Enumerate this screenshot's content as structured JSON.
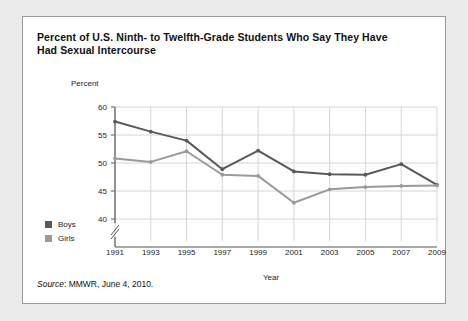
{
  "title": "Percent of U.S. Ninth- to Twelfth-Grade Students Who Say They Have Had Sexual Intercourse",
  "source_prefix": "Source",
  "source_text": ": MMWR, June 4, 2010.",
  "legend": {
    "boys_label": "Boys",
    "girls_label": "Girls"
  },
  "colors": {
    "boys": "#585858",
    "girls": "#9a9a9a",
    "grid": "#d6d6d6",
    "axis": "#555555",
    "panel_border": "#9a9a9a",
    "background": "#ebebeb"
  },
  "chart_data": {
    "type": "line",
    "title": "Percent of U.S. Ninth- to Twelfth-Grade Students Who Say They Have Had Sexual Intercourse",
    "xlabel": "Year",
    "ylabel": "Percent",
    "x": [
      1991,
      1993,
      1995,
      1997,
      1999,
      2001,
      2003,
      2005,
      2007,
      2009
    ],
    "xtick_labels": [
      "1991",
      "1993",
      "1995",
      "1997",
      "1999",
      "2001",
      "2003",
      "2005",
      "2007",
      "2009"
    ],
    "ytick_labels": [
      "40",
      "45",
      "50",
      "55",
      "60"
    ],
    "yticks": [
      40,
      45,
      50,
      55,
      60
    ],
    "ylim": [
      40,
      60
    ],
    "y_axis_break": true,
    "grid": true,
    "legend_position": "left-outside",
    "series": [
      {
        "name": "Boys",
        "color": "#585858",
        "values": [
          57.4,
          55.6,
          54.0,
          48.9,
          52.2,
          48.5,
          48.0,
          47.9,
          49.8,
          46.1
        ]
      },
      {
        "name": "Girls",
        "color": "#9a9a9a",
        "values": [
          50.8,
          50.2,
          52.1,
          47.9,
          47.7,
          42.9,
          45.3,
          45.7,
          45.9,
          46.0
        ]
      }
    ]
  }
}
